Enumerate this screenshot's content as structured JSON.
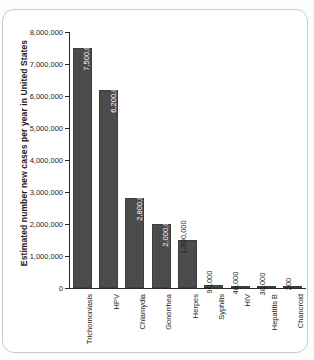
{
  "chart_data": {
    "type": "bar",
    "title": "",
    "xlabel": "",
    "ylabel": "Estimated number new cases per year in United States",
    "ylim": [
      0,
      8000000
    ],
    "grid": false,
    "legend": false,
    "orientation": "vertical",
    "bar_color": "#4c4c4c",
    "categories": [
      "Trichomoniasis",
      "HPV",
      "Chlamydia",
      "Gonorrhea",
      "Herpes",
      "Syphilis",
      "HIV",
      "Hepatitis B",
      "Chancroid"
    ],
    "values": [
      7500000,
      6200000,
      2800000,
      2000000,
      1500000,
      90000,
      48000,
      38000,
      200
    ],
    "value_labels": [
      "7,500,000",
      "6,200,000",
      "2,800,000",
      "2,000,000",
      "1,500,000",
      "90,000",
      "48,000",
      "38,000",
      "200"
    ],
    "value_label_position": [
      "inside",
      "inside",
      "inside",
      "inside",
      "outside",
      "outside",
      "outside",
      "outside",
      "outside"
    ],
    "ytick_labels": [
      "8,000,000",
      "7,000,000",
      "6,000,000",
      "5,000,000",
      "4,000,000",
      "3,000,000",
      "2,000,000",
      "1,000,000",
      "0"
    ],
    "ytick_values": [
      8000000,
      7000000,
      6000000,
      5000000,
      4000000,
      3000000,
      2000000,
      1000000,
      0
    ]
  }
}
